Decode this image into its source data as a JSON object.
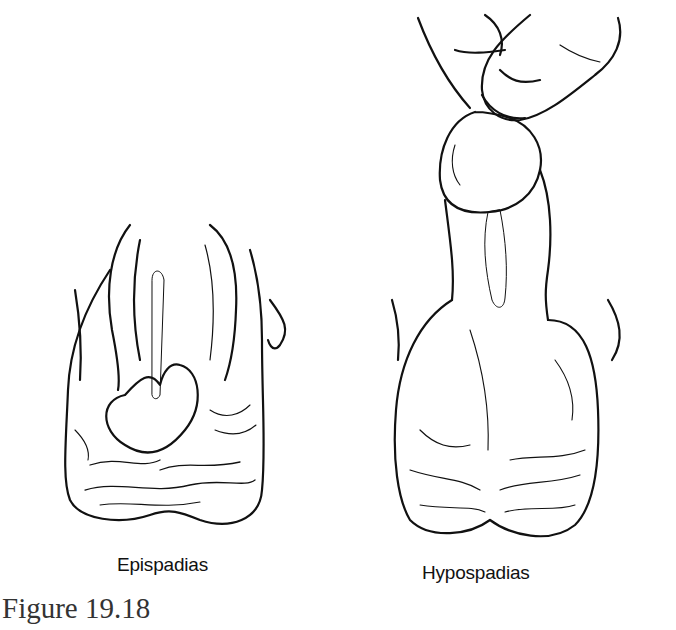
{
  "figure": {
    "caption": "Figure 19.18",
    "panels": [
      {
        "label": "Epispadias",
        "illustration": "epispadias-drawing"
      },
      {
        "label": "Hypospadias",
        "illustration": "hypospadias-drawing"
      }
    ]
  },
  "colors": {
    "ink": "#111111",
    "caption": "#333333",
    "background": "#ffffff"
  }
}
